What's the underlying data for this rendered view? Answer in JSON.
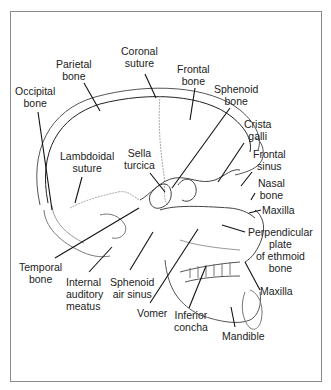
{
  "diagram": {
    "labels": [
      {
        "id": "parietal-bone",
        "lines": [
          "Parietal",
          "bone"
        ],
        "x": 56,
        "y": 58,
        "align": "center"
      },
      {
        "id": "coronal-suture",
        "lines": [
          "Coronal",
          "suture"
        ],
        "x": 121,
        "y": 45,
        "align": "center"
      },
      {
        "id": "frontal-bone",
        "lines": [
          "Frontal",
          "bone"
        ],
        "x": 177,
        "y": 63,
        "align": "center"
      },
      {
        "id": "occipital-bone",
        "lines": [
          "Occipital",
          "bone"
        ],
        "x": 15,
        "y": 85,
        "align": "center"
      },
      {
        "id": "sphenoid-bone",
        "lines": [
          "Sphenoid",
          "bone"
        ],
        "x": 214,
        "y": 83,
        "align": "center"
      },
      {
        "id": "crista-galli",
        "lines": [
          "Crista",
          "galli"
        ],
        "x": 244,
        "y": 118,
        "align": "center"
      },
      {
        "id": "lambdoidal-suture",
        "lines": [
          "Lambdoidal",
          "suture"
        ],
        "x": 60,
        "y": 150,
        "align": "center"
      },
      {
        "id": "sella-turcica",
        "lines": [
          "Sella",
          "turcica"
        ],
        "x": 124,
        "y": 147,
        "align": "center"
      },
      {
        "id": "frontal-sinus",
        "lines": [
          "Frontal",
          "sinus"
        ],
        "x": 253,
        "y": 148,
        "align": "center"
      },
      {
        "id": "nasal-bone",
        "lines": [
          "Nasal",
          "bone"
        ],
        "x": 258,
        "y": 177,
        "align": "center"
      },
      {
        "id": "maxilla-upper",
        "lines": [
          "Maxilla"
        ],
        "x": 262,
        "y": 204,
        "align": "left"
      },
      {
        "id": "perpendicular-plate",
        "lines": [
          "Perpendicular",
          "plate",
          "of ethmoid",
          "bone"
        ],
        "x": 248,
        "y": 226,
        "align": "center"
      },
      {
        "id": "temporal-bone",
        "lines": [
          "Temporal",
          "bone"
        ],
        "x": 19,
        "y": 261,
        "align": "center"
      },
      {
        "id": "internal-auditory-meatus",
        "lines": [
          "Internal",
          "auditory",
          "meatus"
        ],
        "x": 66,
        "y": 276,
        "align": "left"
      },
      {
        "id": "sphenoid-air-sinus",
        "lines": [
          "Sphenoid",
          "air sinus"
        ],
        "x": 110,
        "y": 276,
        "align": "center"
      },
      {
        "id": "vomer",
        "lines": [
          "Vomer"
        ],
        "x": 137,
        "y": 307,
        "align": "left"
      },
      {
        "id": "maxilla-lower",
        "lines": [
          "Maxilla"
        ],
        "x": 260,
        "y": 285,
        "align": "left"
      },
      {
        "id": "inferior-concha",
        "lines": [
          "Inferior",
          "concha"
        ],
        "x": 174,
        "y": 309,
        "align": "center"
      },
      {
        "id": "mandible",
        "lines": [
          "Mandible"
        ],
        "x": 222,
        "y": 330,
        "align": "left"
      }
    ]
  }
}
